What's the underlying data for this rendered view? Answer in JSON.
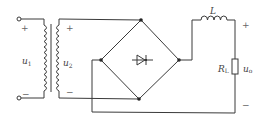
{
  "diagram": {
    "type": "circuit-schematic",
    "components": {
      "transformer": {
        "primary_label": "u",
        "primary_sub": "1",
        "secondary_label": "u",
        "secondary_sub": "2"
      },
      "diode_bridge": {
        "symbol": "diode"
      },
      "inductor": {
        "label": "L"
      },
      "resistor": {
        "label": "R",
        "sub": "L"
      },
      "output": {
        "label": "u",
        "sub": "o"
      }
    },
    "polarity": {
      "primary_plus": "+",
      "primary_minus": "−",
      "secondary_plus": "+",
      "secondary_minus": "−",
      "output_plus": "+",
      "output_minus": "−"
    },
    "colors": {
      "wire": "#3a3a3a",
      "node": "#222222",
      "label": "#444444",
      "background": "#ffffff"
    }
  }
}
